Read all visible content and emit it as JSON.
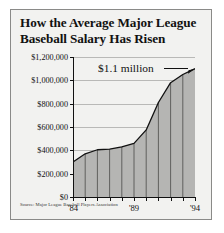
{
  "figure": {
    "title_line1": "How the Average Major League",
    "title_line2": "Baseball Salary Has Risen",
    "source": "Source: Major League Baseball Players Association",
    "annotation": "$1.1 million",
    "background_color": "#f2f2f0",
    "fill_color": "#b5b5b3",
    "line_color": "#111111",
    "grid_color": "#b9b9b7"
  },
  "chart_data": {
    "type": "area",
    "title": "How the Average Major League Baseball Salary Has Risen",
    "xlabel": "",
    "ylabel": "",
    "x": [
      "'84",
      "'85",
      "'86",
      "'87",
      "'88",
      "'89",
      "'90",
      "'91",
      "'92",
      "'93",
      "'94"
    ],
    "x_tick_labels_shown": [
      "'84",
      "'89",
      "'94"
    ],
    "values": [
      300000,
      370000,
      405000,
      410000,
      430000,
      460000,
      575000,
      810000,
      980000,
      1050000,
      1100000
    ],
    "ylim": [
      0,
      1200000
    ],
    "xlim": [
      "'84",
      "'94"
    ],
    "y_tick_values": [
      0,
      200000,
      400000,
      600000,
      800000,
      1000000,
      1200000
    ],
    "y_tick_labels": [
      "$0",
      "$200,000",
      "$400,000",
      "$600,000",
      "$800,000",
      "$1,000,000",
      "$1,200,000"
    ],
    "grid": "horizontal",
    "legend": "none",
    "annotations": [
      {
        "text": "$1.1 million",
        "points_to_x": "'94",
        "points_to_y": 1100000
      }
    ],
    "source": "Source: Major League Baseball Players Association"
  }
}
